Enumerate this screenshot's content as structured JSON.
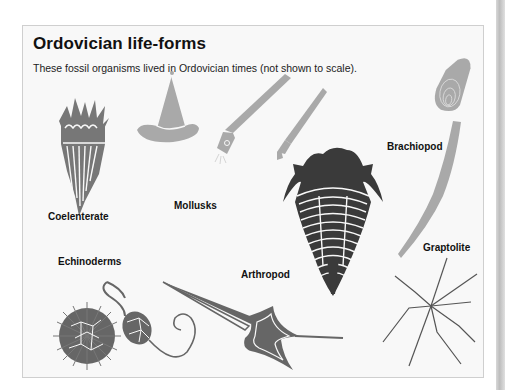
{
  "figure": {
    "title": "Ordovician life-forms",
    "subtitle": "These fossil organisms lived in Ordovician times (not shown to scale).",
    "labels": {
      "coelenterate": "Coelenterate",
      "mollusks": "Mollusks",
      "brachiopod": "Brachiopod",
      "echinoderms": "Echinoderms",
      "arthropod": "Arthropod",
      "graptolite": "Graptolite"
    },
    "colors": {
      "panel_bg": "#f8f8f8",
      "light_gray": "#a9a9a9",
      "mid_gray": "#777777",
      "dark_gray": "#3a3a3a"
    }
  }
}
